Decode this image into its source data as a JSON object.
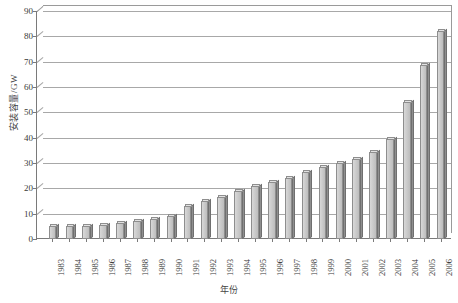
{
  "chart_data": {
    "type": "bar",
    "title": "",
    "xlabel": "年份",
    "ylabel": "安装容量/GW",
    "ylim": [
      0,
      90
    ],
    "ytick_step": 10,
    "yticks": [
      0,
      10,
      20,
      30,
      40,
      50,
      60,
      70,
      80,
      90
    ],
    "ytick_labels": [
      "0",
      "10",
      "20",
      "30",
      "40",
      "50",
      "60",
      "70",
      "80",
      "90"
    ],
    "grid": true,
    "legend": "none",
    "categories": [
      "1983",
      "1984",
      "1985",
      "1986",
      "1987",
      "1988",
      "1989",
      "1990",
      "1991",
      "1992",
      "1993",
      "1994",
      "1995",
      "1996",
      "1997",
      "1998",
      "1999",
      "2000",
      "2001",
      "2002",
      "2003",
      "2004",
      "2005",
      "2006"
    ],
    "values": [
      5,
      5,
      5,
      5.5,
      6.5,
      7,
      8,
      9,
      13,
      15,
      16.5,
      19,
      21,
      22.5,
      24,
      26.5,
      28.5,
      30,
      31.5,
      34.5,
      39.5,
      54,
      68.5,
      82
    ],
    "bar_color": "#c9c9c9",
    "bar_edge_color": "#8e8e8e",
    "grid_color": "#a8a8a8",
    "axis_color": "#7a7a7a"
  }
}
